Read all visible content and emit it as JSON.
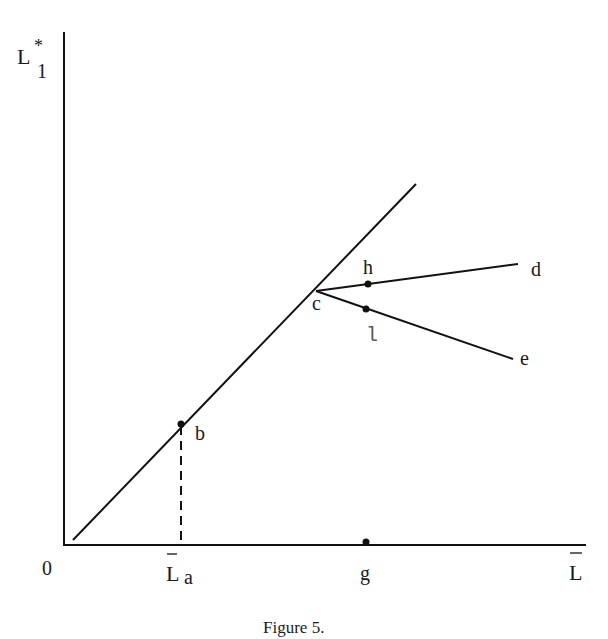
{
  "figure": {
    "caption": "Figure 5.",
    "axes": {
      "y_label_main": "L",
      "y_label_sup": "*",
      "y_label_sub": "1",
      "origin_label": "0",
      "x_tick_La_main": "L",
      "x_tick_La_sub": "a",
      "x_tick_g": "g",
      "x_end_label": "L"
    },
    "points": {
      "b": "b",
      "c": "c",
      "d": "d",
      "e": "e",
      "h": "h",
      "l": "l"
    },
    "colors": {
      "line": "#111111",
      "text": "#1a1a1a",
      "background": "#ffffff"
    }
  }
}
